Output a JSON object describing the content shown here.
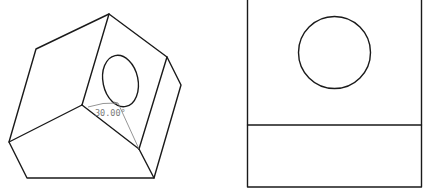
{
  "figure": {
    "left_view": {
      "name": "isometric-view",
      "angle_annotation": "30.00°"
    },
    "right_view": {
      "name": "front-view"
    }
  },
  "colors": {
    "line": "#1a1a1a",
    "dimension": "#7a7a7a",
    "background": "#ffffff"
  }
}
